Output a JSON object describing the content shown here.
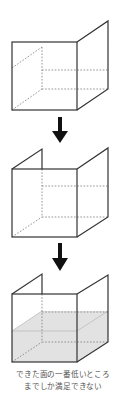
{
  "diagram": {
    "colors": {
      "line": "#333333",
      "dashed": "#888888",
      "water_fill": "#e2e2e2",
      "water_line": "#bbbbbb",
      "arrow": "#111111",
      "caption": "#555555"
    },
    "steps": [
      {
        "name": "box-one-side-raised",
        "description": "Open box with right side panel taller"
      },
      {
        "name": "box-two-sides-raised",
        "description": "Open box with right and back-left panels taller"
      },
      {
        "name": "box-filled-to-lowest",
        "description": "Water fills only to the lowest face"
      }
    ],
    "arrows": [
      {
        "name": "arrow-down-1"
      },
      {
        "name": "arrow-down-2"
      }
    ],
    "caption": {
      "line1": "できた面の一番低いところ",
      "line2": "までしか満足できない"
    }
  }
}
